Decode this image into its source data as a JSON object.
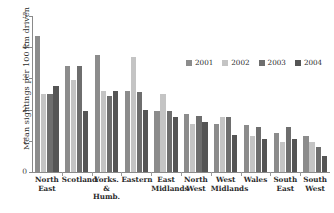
{
  "chart_data": {
    "type": "bar",
    "title": "",
    "xlabel": "",
    "ylabel": "Mean sightings per 100 km driven",
    "ylim": [
      0,
      5
    ],
    "yticks": [
      0,
      1,
      2,
      3,
      4,
      5
    ],
    "ytick_labels": [
      "0",
      "1",
      "2",
      "3",
      "4",
      "5"
    ],
    "grid": false,
    "legend_position": "upper-right-inside",
    "categories": [
      "North East",
      "Scotland",
      "Yorks. & Humb.",
      "Eastern",
      "East Midlands",
      "North West",
      "West Midlands",
      "Wales",
      "South East",
      "South West"
    ],
    "category_lines": [
      [
        "North",
        "East"
      ],
      [
        "Scotland"
      ],
      [
        "Yorks.",
        "&",
        "Humb."
      ],
      [
        "Eastern"
      ],
      [
        "East",
        "Midlands"
      ],
      [
        "North",
        "West"
      ],
      [
        "West",
        "Midlands"
      ],
      [
        "Wales"
      ],
      [
        "South",
        "East"
      ],
      [
        "South",
        "West"
      ]
    ],
    "series": [
      {
        "name": "2001",
        "color": "#8c8c8c",
        "values": [
          4.35,
          3.4,
          3.75,
          2.6,
          1.95,
          1.85,
          1.55,
          1.5,
          1.25,
          1.15
        ]
      },
      {
        "name": "2002",
        "color": "#c4c4c4",
        "values": [
          2.5,
          2.95,
          2.6,
          3.7,
          2.5,
          1.55,
          1.75,
          1.15,
          0.95,
          0.95
        ]
      },
      {
        "name": "2003",
        "color": "#6e6e6e",
        "values": [
          2.5,
          3.4,
          2.45,
          2.55,
          1.95,
          1.8,
          1.75,
          1.45,
          1.45,
          0.8
        ]
      },
      {
        "name": "2004",
        "color": "#555555",
        "values": [
          2.75,
          1.95,
          2.6,
          2.0,
          1.75,
          1.6,
          1.2,
          1.05,
          1.05,
          0.5
        ]
      }
    ]
  },
  "colors": {
    "axis": "#8a8a8a",
    "text": "#2b2b2b",
    "background": "#ffffff"
  }
}
